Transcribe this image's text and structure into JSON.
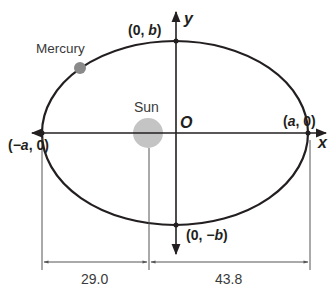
{
  "diagram": {
    "colors": {
      "line": "#231f20",
      "sun": "#bdbdbd",
      "mercury": "#8a8a8a",
      "dimension": "#555555"
    },
    "axes": {
      "x_label": "x",
      "y_label": "y",
      "origin_label": "O"
    },
    "bodies": {
      "sun_label": "Sun",
      "planet_label": "Mercury"
    },
    "vertices": {
      "left": {
        "prefix": "(",
        "var": "−a",
        "suffix": ", 0)"
      },
      "right": {
        "prefix": "(",
        "var": "a",
        "suffix": ", 0)"
      },
      "top": {
        "prefix": "(0, ",
        "var": "b",
        "suffix": ")"
      },
      "bottom": {
        "prefix": "(0, ",
        "var": "−b",
        "suffix": ")"
      }
    },
    "dimensions": {
      "perihelion_distance": "29.0",
      "aphelion_distance": "43.8"
    }
  }
}
